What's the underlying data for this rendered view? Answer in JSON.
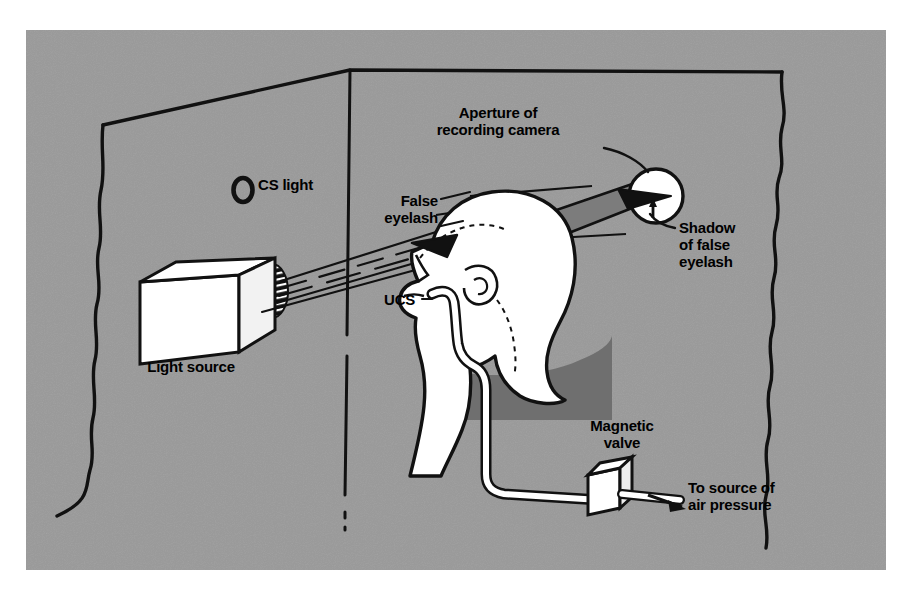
{
  "figure": {
    "background_color": "#9a9a9a",
    "ink_color": "#111111",
    "white_color": "#ffffff",
    "shadow_color": "#6f6f6f",
    "beam_color": "#7c7c7c",
    "panel": {
      "left": 26,
      "top": 30,
      "width": 860,
      "height": 540
    }
  },
  "labels": {
    "aperture": "Aperture of\nrecording camera",
    "cs_light": "CS light",
    "false_eyelash": "False\neyelash",
    "shadow_of_false_eyelash": "Shadow\nof false\neyelash",
    "ucs": "UCS",
    "light_source": "Light source",
    "magnetic_valve": "Magnetic\nvalve",
    "to_source_of_air_pressure": "To source of\nair pressure"
  },
  "parts": {
    "light_source_cube": "light-source-cube",
    "lens": "hatched-lens",
    "cs_light_ring": "cs-light-ring",
    "head": "subject-head-profile",
    "eyelash_wedge": "false-eyelash-wedge",
    "camera_aperture": "camera-aperture-circle",
    "shadow_wedge": "shadow-wedge",
    "air_tube": "air-tube",
    "valve_box": "magnetic-valve-box",
    "air_arrow": "air-pressure-arrow",
    "wall_corner": "wall-corner-line",
    "torn_edges": "torn-paper-edges"
  }
}
